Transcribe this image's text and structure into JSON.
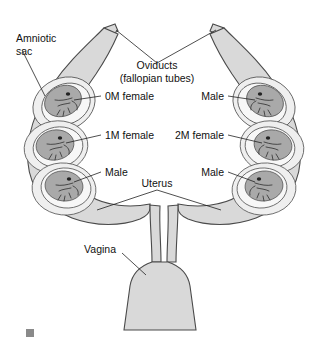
{
  "figure": {
    "marker_color": "#8a8a8a"
  },
  "palette": {
    "uterus_wall": "#d9d9d9",
    "sac_outer": "#efefef",
    "sac_inner": "#f7f7f7",
    "fetus_body": "#a9a9a9",
    "fetus_body_light": "#c2c2c2",
    "outline": "#4a4a4a",
    "text": "#111111",
    "background": "#ffffff"
  },
  "labels": {
    "amniotic_sac": "Amniotic\nsac",
    "amniotic_sac_line1": "Amniotic",
    "amniotic_sac_line2": "sac",
    "oviducts_line1": "Oviducts",
    "oviducts_line2": "(fallopian tubes)",
    "uterus": "Uterus",
    "vagina": "Vagina"
  },
  "left_horn": {
    "name": "left-uterine-horn",
    "fetuses": [
      {
        "label": "0M female",
        "sex": "female",
        "males_adjacent": 0,
        "position": "top"
      },
      {
        "label": "1M female",
        "sex": "female",
        "males_adjacent": 1,
        "position": "middle"
      },
      {
        "label": "Male",
        "sex": "male",
        "males_adjacent": null,
        "position": "bottom"
      }
    ]
  },
  "right_horn": {
    "name": "right-uterine-horn",
    "fetuses": [
      {
        "label": "Male",
        "sex": "male",
        "males_adjacent": null,
        "position": "top"
      },
      {
        "label": "2M female",
        "sex": "female",
        "males_adjacent": 2,
        "position": "middle"
      },
      {
        "label": "Male",
        "sex": "male",
        "males_adjacent": null,
        "position": "bottom"
      }
    ]
  }
}
